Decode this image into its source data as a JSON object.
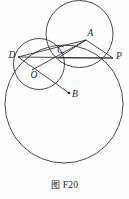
{
  "figure": {
    "caption_cn": "图",
    "caption_id": "F20",
    "caption_full": "图 F20",
    "background_color": "#fefefe",
    "stroke_color": "#2b2b2b",
    "label_color": "#1c1c1c",
    "width": 129,
    "height": 199
  },
  "points": [
    {
      "name": "D",
      "label": "D",
      "x": 18.0,
      "y": 57.0,
      "label_dx": -9.5,
      "label_dy": 0.5,
      "dot": false
    },
    {
      "name": "C",
      "label": "C",
      "x": 58.0,
      "y": 58.0,
      "label_dx": -1.0,
      "label_dy": -5.0,
      "dot": false
    },
    {
      "name": "A",
      "label": "A",
      "x": 86.0,
      "y": 40.0,
      "label_dx": 1.5,
      "label_dy": -4.0,
      "dot": false
    },
    {
      "name": "P",
      "label": "P",
      "x": 113.0,
      "y": 58.0,
      "label_dx": 3.0,
      "label_dy": 1.0,
      "dot": false
    },
    {
      "name": "O",
      "label": "O",
      "x": 32.0,
      "y": 70.0,
      "label_dx": -1.5,
      "label_dy": 7.5,
      "dot": false
    },
    {
      "name": "B",
      "label": "B",
      "x": 69.0,
      "y": 93.0,
      "label_dx": 3.0,
      "label_dy": 4.0,
      "dot": true
    }
  ],
  "circles": [
    {
      "name": "large-circle",
      "cx": 64.0,
      "cy": 104.0,
      "r": 59.0
    },
    {
      "name": "top-circle",
      "cx": 79.5,
      "cy": 34.0,
      "r": 33.5
    },
    {
      "name": "small-circle-O",
      "cx": 39.0,
      "cy": 64.0,
      "r": 25.5
    }
  ],
  "segments": [
    {
      "name": "chord-D-P",
      "x1": 18.0,
      "y1": 57.0,
      "x2": 113.0,
      "y2": 58.0
    },
    {
      "name": "segment-D-A",
      "x1": 18.0,
      "y1": 57.0,
      "x2": 86.0,
      "y2": 40.0
    },
    {
      "name": "segment-A-P",
      "x1": 86.0,
      "y1": 40.0,
      "x2": 113.0,
      "y2": 58.0
    },
    {
      "name": "segment-C-A",
      "x1": 58.0,
      "y1": 58.0,
      "x2": 86.0,
      "y2": 40.0
    },
    {
      "name": "segment-C-P",
      "x1": 58.0,
      "y1": 58.0,
      "x2": 113.0,
      "y2": 58.0
    },
    {
      "name": "ray-D-C-B",
      "x1": 18.0,
      "y1": 57.0,
      "x2": 69.0,
      "y2": 93.0
    },
    {
      "name": "segment-O-C-A",
      "x1": 32.0,
      "y1": 70.0,
      "x2": 86.0,
      "y2": 40.0
    }
  ]
}
